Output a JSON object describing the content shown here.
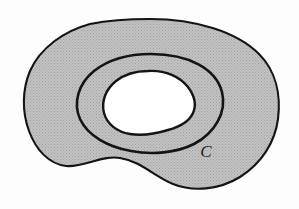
{
  "figure": {
    "background_color": "#fdfdfd",
    "shading": {
      "fill_color": "#b9b9b9",
      "pattern": "halftone-dither",
      "description": "uniform light gray halftone screen fill"
    },
    "stroke": {
      "color": "#141414",
      "outer_width": 2.1,
      "curve_c_width": 2.6,
      "inner_hole_width": 2.4
    },
    "labels": [
      {
        "id": "curve-c",
        "text": "C",
        "style": "italic-serif",
        "x": 206,
        "y": 157,
        "refers_to": "middle closed curve"
      }
    ],
    "shapes": [
      {
        "id": "outer-boundary",
        "name": "outer-blob-boundary",
        "type": "closed-smooth-curve",
        "filled": true,
        "bbox": {
          "x": 24,
          "y": 19,
          "width": 255,
          "height": 172
        }
      },
      {
        "id": "curve-c",
        "name": "curve-c-oval",
        "type": "closed-smooth-curve",
        "filled": false,
        "bbox": {
          "x": 77,
          "y": 54,
          "width": 147,
          "height": 98
        }
      },
      {
        "id": "inner-hole",
        "name": "inner-bean-hole",
        "type": "closed-smooth-curve",
        "filled": false,
        "hole": true,
        "bbox": {
          "x": 103,
          "y": 70,
          "width": 96,
          "height": 66
        }
      }
    ]
  }
}
